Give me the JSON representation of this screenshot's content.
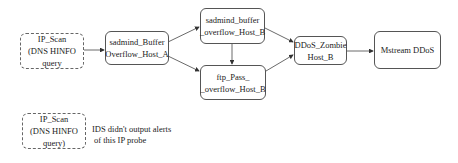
{
  "diagram": {
    "type": "attack-scenario-graph",
    "nodes": [
      {
        "id": "ip_scan_1",
        "style": "dashed",
        "lines": [
          "IP_Scan",
          "(DNS HINFO",
          "query"
        ]
      },
      {
        "id": "sadmind_a",
        "style": "solid",
        "lines": [
          "sadmind_Buffer",
          "Overflow_Host_A"
        ]
      },
      {
        "id": "sadmind_b",
        "style": "solid",
        "lines": [
          "sadmind_buffer",
          "_overflow_Host_B"
        ]
      },
      {
        "id": "ftp_pass_b",
        "style": "solid",
        "lines": [
          "ftp_Pass_",
          "_overflow_Host_B"
        ]
      },
      {
        "id": "ddos_zombie",
        "style": "solid",
        "lines": [
          "DDoS_Zombie",
          "Host_B"
        ]
      },
      {
        "id": "mstream",
        "style": "solid",
        "lines": [
          "Mstream DDoS"
        ]
      },
      {
        "id": "ip_scan_2",
        "style": "dashed",
        "lines": [
          "IP_Scan",
          "(DNS HINFO",
          "query)"
        ]
      }
    ],
    "edges": [
      {
        "from": "ip_scan_1",
        "to": "sadmind_a"
      },
      {
        "from": "sadmind_a",
        "to": "sadmind_b"
      },
      {
        "from": "sadmind_a",
        "to": "ftp_pass_b"
      },
      {
        "from": "sadmind_b",
        "to": "ftp_pass_b"
      },
      {
        "from": "sadmind_b",
        "to": "ddos_zombie"
      },
      {
        "from": "ftp_pass_b",
        "to": "ddos_zombie"
      },
      {
        "from": "ddos_zombie",
        "to": "mstream"
      }
    ],
    "note": {
      "lines": [
        "IDS didn't output alerts",
        "of this IP probe"
      ]
    }
  }
}
